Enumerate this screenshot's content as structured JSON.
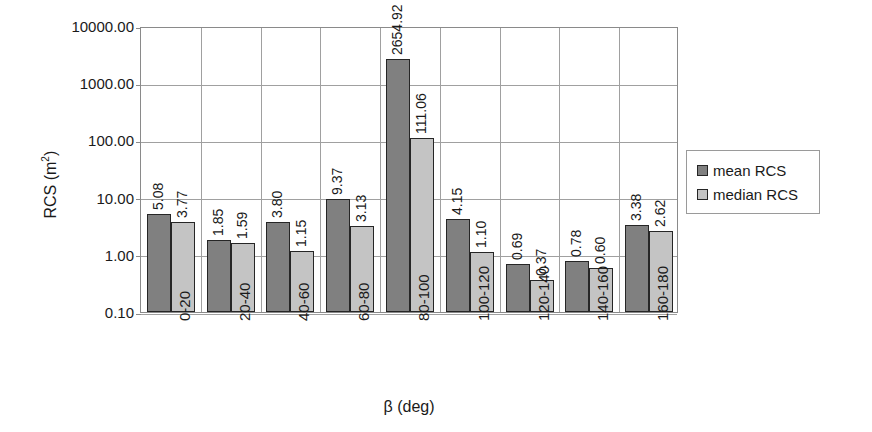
{
  "chart_data": {
    "type": "bar",
    "title": "",
    "xlabel": "β (deg)",
    "ylabel": "RCS (m²)",
    "ylabel_base": "RCS (m",
    "ylabel_sup": "2",
    "ylabel_close": ")",
    "yscale": "log",
    "ylim": [
      0.1,
      10000
    ],
    "grid": true,
    "legend_position": "right",
    "categories": [
      "0-20",
      "20-40",
      "40-60",
      "60-80",
      "80-100",
      "100-120",
      "120-140",
      "140-160",
      "160-180"
    ],
    "ytick_labels": [
      "10000.00",
      "1000.00",
      "100.00",
      "10.00",
      "1.00",
      "0.10"
    ],
    "ytick_values": [
      10000,
      1000,
      100,
      10,
      1,
      0.1
    ],
    "series": [
      {
        "name": "mean RCS",
        "color": "#808080",
        "values": [
          5.08,
          1.85,
          3.8,
          9.37,
          2654.92,
          4.15,
          0.69,
          0.78,
          3.38
        ],
        "labels": [
          "5.08",
          "1.85",
          "3.80",
          "9.37",
          "2654.92",
          "4.15",
          "0.69",
          "0.78",
          "3.38"
        ]
      },
      {
        "name": "median RCS",
        "color": "#c4c4c4",
        "values": [
          3.77,
          1.59,
          1.15,
          3.13,
          111.06,
          1.1,
          0.37,
          0.6,
          2.62
        ],
        "labels": [
          "3.77",
          "1.59",
          "1.15",
          "3.13",
          "111.06",
          "1.10",
          "0.37",
          "0.60",
          "2.62"
        ]
      }
    ]
  },
  "legend": {
    "items": [
      {
        "label": "mean RCS",
        "swatch": "mean"
      },
      {
        "label": "median RCS",
        "swatch": "median"
      }
    ]
  }
}
